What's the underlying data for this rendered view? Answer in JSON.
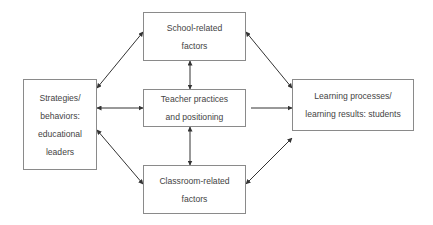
{
  "diagram": {
    "nodes": {
      "school": {
        "lines": [
          "School-related",
          "factors"
        ]
      },
      "teacher": {
        "lines": [
          "Teacher practices",
          "and positioning"
        ]
      },
      "classroom": {
        "lines": [
          "Classroom-related",
          "factors"
        ]
      },
      "leaders": {
        "lines": [
          "Strategies/",
          "behaviors:",
          "educational",
          "leaders"
        ]
      },
      "students": {
        "lines": [
          "Learning processes/",
          "learning results: students"
        ]
      }
    },
    "edges": [
      {
        "from": "leaders",
        "to": "school",
        "type": "bidirectional"
      },
      {
        "from": "leaders",
        "to": "teacher",
        "type": "bidirectional"
      },
      {
        "from": "leaders",
        "to": "classroom",
        "type": "bidirectional"
      },
      {
        "from": "school",
        "to": "teacher",
        "type": "bidirectional"
      },
      {
        "from": "teacher",
        "to": "classroom",
        "type": "bidirectional"
      },
      {
        "from": "school",
        "to": "students",
        "type": "bidirectional"
      },
      {
        "from": "teacher",
        "to": "students",
        "type": "directed"
      },
      {
        "from": "classroom",
        "to": "students",
        "type": "bidirectional"
      }
    ],
    "colors": {
      "border": "#8a8a8a",
      "arrow": "#333333",
      "text": "#444444"
    }
  }
}
